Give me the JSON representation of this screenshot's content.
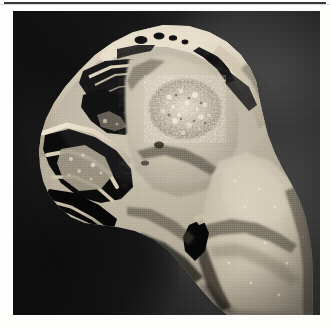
{
  "page": {
    "kind": "printed-figure-page",
    "background_color": "#fdfdfc",
    "top_rule_color": "#2e2e2e"
  },
  "figure": {
    "name": "gross-pathology-photograph",
    "modality": "gross specimen photograph",
    "color_mode": "grayscale",
    "orientation": "sagittal / paramedian section of facial skeleton",
    "plate": {
      "x": 13,
      "y": 11,
      "width": 307,
      "height": 304,
      "background_color": "#1b1b1b",
      "background_description": "dark matte photographic backdrop, nearly black at left and lighter charcoal gray at right"
    },
    "specimen": {
      "description": "Cut surface of a resected facial / paranasal block showing air-filled sinus cavities outlined by bright thin bony septa and a pale bulky soft-tissue mass filling the maxillary antrum and extending inferiorly.",
      "tone_range": {
        "darkest": "#070707",
        "bone_bright": "#ece2cf",
        "tissue_mid": "#b9b0a0"
      },
      "regions": [
        {
          "name": "frontal-sinus-cavity",
          "appearance": "irregular black air space at upper left rimmed by bright bone"
        },
        {
          "name": "ethmoid-air-cells",
          "appearance": "small dark loculi within bright trabecular bone along the upper margin"
        },
        {
          "name": "nasal-cavity-and-turbinates",
          "appearance": "thin curling bony plates with intervening dark air channels at left"
        },
        {
          "name": "central-tumor-mass",
          "appearance": "pale homogeneous mass occupying the antrum with a granular nodular focus centrally"
        },
        {
          "name": "granular-nodular-focus",
          "appearance": "coarse speckled calcified / bony-spicule cluster near the centre of the mass"
        },
        {
          "name": "inferior-soft-tissue-extension",
          "appearance": "bulky pale lobulated tissue filling the lower right of the section"
        },
        {
          "name": "posterior-bony-rim",
          "appearance": "bright curved cortical bone along the upper right border"
        },
        {
          "name": "cut-surface-fissures",
          "appearance": "dark linear clefts crossing the pale tissue"
        }
      ]
    }
  }
}
